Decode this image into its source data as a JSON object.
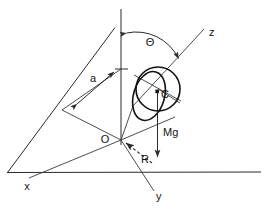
{
  "figure": {
    "background_color": "#ffffff",
    "line_color": "#2b2b2b",
    "body_line_color": "#111111",
    "width": 267,
    "height": 218
  },
  "labels": {
    "theta": "Θ",
    "z_axis": "z",
    "y_axis": "y",
    "x_axis": "x",
    "origin": "O",
    "center_of_mass": "C",
    "weight": "Mg",
    "reaction": "R",
    "distance": "a"
  },
  "elements": {
    "vertical_axis": "vertical-reference-axis",
    "horizontal_ground": "ground-line",
    "incline_line": "incline-edge-line",
    "z_axis_line": "z-axis-line",
    "y_axis_line": "y-axis-line",
    "x_axis_line": "x-axis-line",
    "disk_circle": "disk-circle",
    "disk_ellipse": "disk-ellipse",
    "theta_arc": "theta-angle-arc",
    "dimension_a": "dimension-line-a",
    "mg_vector": "weight-vector-arrow",
    "r_vector": "reaction-vector-arrow",
    "center_dot": "center-of-mass-dot"
  },
  "geometry": {
    "origin_point": [
      121,
      140
    ],
    "center_point": [
      158,
      89
    ],
    "disk_radius": 22,
    "theta_arc_radius": 46
  }
}
